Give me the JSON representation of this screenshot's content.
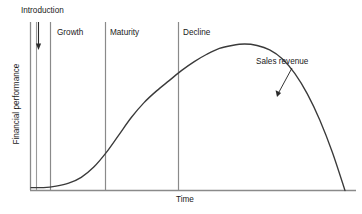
{
  "chart_data": {
    "type": "line",
    "title": "",
    "subtitle": "",
    "xlabel": "Time",
    "ylabel": "Financial performance",
    "xlim": [
      0,
      100
    ],
    "ylim": [
      0,
      100
    ],
    "grid": false,
    "legend_position": "inline-annotation",
    "x_tick_labels": [],
    "y_tick_labels": [],
    "series": [
      {
        "name": "Sales revenue",
        "color": "#3a3a3a",
        "points": [
          {
            "x": 0,
            "y": 2
          },
          {
            "x": 4,
            "y": 2
          },
          {
            "x": 8,
            "y": 3
          },
          {
            "x": 12,
            "y": 5
          },
          {
            "x": 16,
            "y": 9
          },
          {
            "x": 20,
            "y": 16
          },
          {
            "x": 24,
            "y": 26
          },
          {
            "x": 28,
            "y": 38
          },
          {
            "x": 32,
            "y": 50
          },
          {
            "x": 36,
            "y": 60
          },
          {
            "x": 40,
            "y": 68
          },
          {
            "x": 44,
            "y": 75
          },
          {
            "x": 48,
            "y": 82
          },
          {
            "x": 52,
            "y": 88
          },
          {
            "x": 56,
            "y": 93
          },
          {
            "x": 60,
            "y": 97
          },
          {
            "x": 64,
            "y": 99
          },
          {
            "x": 68,
            "y": 100
          },
          {
            "x": 72,
            "y": 99
          },
          {
            "x": 76,
            "y": 96
          },
          {
            "x": 80,
            "y": 90
          },
          {
            "x": 84,
            "y": 80
          },
          {
            "x": 88,
            "y": 66
          },
          {
            "x": 92,
            "y": 48
          },
          {
            "x": 96,
            "y": 26
          },
          {
            "x": 100,
            "y": 0
          }
        ]
      }
    ],
    "phases": [
      {
        "name": "Introduction",
        "start": 0,
        "end": 8,
        "label_x": 6,
        "label_y": 98
      },
      {
        "name": "Growth",
        "start": 8,
        "end": 31,
        "label_x": 12,
        "label_y": 88
      },
      {
        "name": "Maturity",
        "start": 31,
        "end": 56,
        "label_x": 34,
        "label_y": 88
      },
      {
        "name": "Decline",
        "start": 56,
        "end": 100,
        "label_x": 59,
        "label_y": 88
      }
    ],
    "dividers_x": [
      2,
      8,
      31,
      56
    ],
    "annotations": [
      {
        "text": "Sales revenue",
        "target_x": 82,
        "target_y": 62,
        "label_x": 88,
        "label_y": 78
      },
      {
        "text": "Introduction",
        "arrow_from_y": 98,
        "arrow_to_y": 84,
        "arrow_x": 4
      }
    ]
  },
  "labels": {
    "introduction": "Introduction",
    "growth": "Growth",
    "maturity": "Maturity",
    "decline": "Decline",
    "sales_revenue": "Sales revenue",
    "time": "Time",
    "financial_performance": "Financial performance"
  },
  "colors": {
    "curve": "#3a3a3a",
    "axis": "#8a8a8a",
    "divider": "#8a8a8a",
    "text": "#1a1a1a",
    "background": "#ffffff"
  }
}
